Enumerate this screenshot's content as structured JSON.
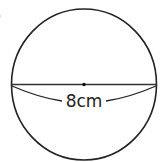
{
  "figure": {
    "marker": ")",
    "shape": "circle",
    "diameter_label": "8cm",
    "colors": {
      "stroke": "#222222",
      "background": "#ffffff"
    }
  }
}
